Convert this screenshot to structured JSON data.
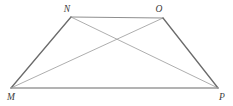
{
  "figure": {
    "name": "trapezoid-mnop-with-diagonals",
    "canvas": {
      "width": 233,
      "height": 106,
      "background": "#ffffff"
    },
    "style": {
      "leg_color": "#6b6b6b",
      "base_color": "#9a9a9a",
      "top_color": "#8f8f8f",
      "diagonal_color": "#a5a5a5",
      "label_color": "#3c3c3c",
      "leg_width": 1.3,
      "base_width": 1.5,
      "top_width": 1.1,
      "diagonal_width": 0.9
    },
    "vertices": [
      {
        "id": "M",
        "label": "M",
        "x": 11,
        "y": 88,
        "label_x": 7,
        "label_y": 100
      },
      {
        "id": "N",
        "label": "N",
        "x": 71,
        "y": 17,
        "label_x": 67,
        "label_y": 12
      },
      {
        "id": "O",
        "label": "O",
        "x": 163,
        "y": 18,
        "label_x": 159,
        "label_y": 12
      },
      {
        "id": "P",
        "label": "P",
        "x": 218,
        "y": 88,
        "label_x": 219,
        "label_y": 100
      }
    ],
    "edges": [
      {
        "id": "MN",
        "from": "M",
        "to": "N",
        "role": "left-leg",
        "x1": 11,
        "y1": 88,
        "x2": 71,
        "y2": 17
      },
      {
        "id": "NO",
        "from": "N",
        "to": "O",
        "role": "top-base",
        "x1": 71,
        "y1": 17,
        "x2": 163,
        "y2": 18
      },
      {
        "id": "OP",
        "from": "O",
        "to": "P",
        "role": "right-leg",
        "x1": 163,
        "y1": 18,
        "x2": 218,
        "y2": 88
      },
      {
        "id": "MP",
        "from": "M",
        "to": "P",
        "role": "bottom-base",
        "x1": 11,
        "y1": 88,
        "x2": 218,
        "y2": 88
      }
    ],
    "diagonals": [
      {
        "id": "MO",
        "from": "M",
        "to": "O",
        "x1": 11,
        "y1": 88,
        "x2": 163,
        "y2": 18
      },
      {
        "id": "NP",
        "from": "N",
        "to": "P",
        "x1": 71,
        "y1": 17,
        "x2": 218,
        "y2": 88
      }
    ],
    "intersection": {
      "id": "diagonal-crossing",
      "x": 120,
      "y": 43
    }
  }
}
